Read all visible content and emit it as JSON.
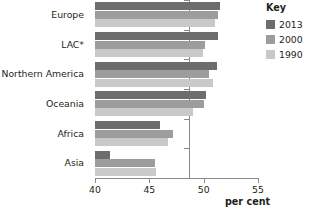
{
  "chart_data": {
    "type": "bar",
    "orientation": "horizontal",
    "title": "",
    "subtitle": "",
    "xlabel": "per cent",
    "ylabel": "",
    "xlim": [
      40,
      55
    ],
    "xticks": [
      40,
      45,
      50,
      55
    ],
    "xtick_labels": [
      "40",
      "45",
      "50",
      "55"
    ],
    "grid": false,
    "legend_position": "top-right",
    "legend_title": "Key",
    "categories": [
      "Europe",
      "LAC*",
      "Northern America",
      "Oceania",
      "Africa",
      "Asia"
    ],
    "series": [
      {
        "name": "2013",
        "color": "#6d6d6d",
        "values": [
          51.5,
          51.3,
          51.2,
          50.2,
          46.0,
          41.4
        ]
      },
      {
        "name": "2000",
        "color": "#9d9d9d",
        "values": [
          51.3,
          50.1,
          50.5,
          50.0,
          47.2,
          45.5
        ]
      },
      {
        "name": "1990",
        "color": "#c9c9c9",
        "values": [
          51.0,
          49.9,
          50.9,
          49.0,
          46.7,
          45.6
        ]
      }
    ]
  },
  "legend": {
    "title": "Key",
    "entries": [
      {
        "label": "2013",
        "color": "#6d6d6d"
      },
      {
        "label": "2000",
        "color": "#9d9d9d"
      },
      {
        "label": "1990",
        "color": "#c9c9c9"
      }
    ]
  },
  "axis": {
    "unit_label": "per cent",
    "tick_labels": [
      "40",
      "45",
      "50",
      "55"
    ]
  },
  "colors": {
    "axis": "#8a8a8a",
    "text": "#231f20",
    "background": "#ffffff"
  }
}
